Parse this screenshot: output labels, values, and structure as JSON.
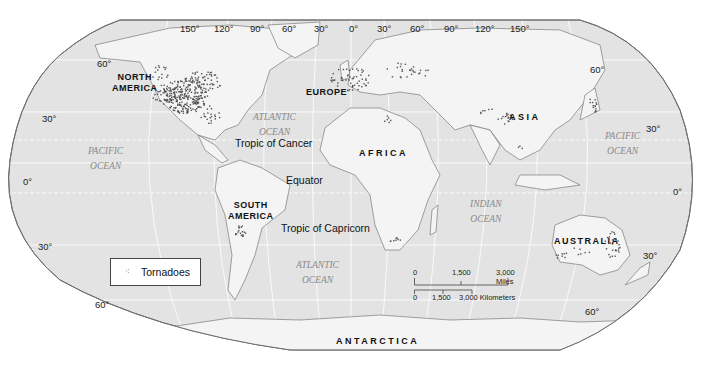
{
  "map": {
    "title": "World Tornado Distribution",
    "projection": "Robinson (oval)",
    "colors": {
      "ocean": "#e3e3e3",
      "land": "#f4f4f4",
      "graticule": "#ffffff",
      "outline": "#6e6e6e",
      "tornado_dots": "#555555"
    },
    "longitude_labels": [
      "150°",
      "120°",
      "90°",
      "60°",
      "30°",
      "0°",
      "30°",
      "60°",
      "90°",
      "120°",
      "150°"
    ],
    "latitude_labels_left": [
      "60°",
      "30°",
      "0°",
      "30°",
      "60°"
    ],
    "latitude_labels_right": [
      "60°",
      "30°",
      "0°",
      "30°",
      "60°"
    ],
    "continents": {
      "north_america": [
        "NORTH",
        "AMERICA"
      ],
      "south_america": [
        "SOUTH",
        "AMERICA"
      ],
      "europe": "EUROPE",
      "africa": "AFRICA",
      "asia": "ASIA",
      "australia": "AUSTRALIA",
      "antarctica": "ANTARCTICA"
    },
    "oceans": {
      "pacific_west": [
        "PACIFIC",
        "OCEAN"
      ],
      "pacific_east": [
        "PACIFIC",
        "OCEAN"
      ],
      "atlantic_north": [
        "ATLANTIC",
        "OCEAN"
      ],
      "atlantic_south": [
        "ATLANTIC",
        "OCEAN"
      ],
      "indian": [
        "INDIAN",
        "OCEAN"
      ]
    },
    "reference_lines": {
      "tropic_cancer": "Tropic of Cancer",
      "equator": "Equator",
      "tropic_capricorn": "Tropic of Capricorn"
    },
    "legend": {
      "symbol": "⁖",
      "label": "Tornadoes"
    },
    "scale_bar": {
      "miles": [
        "0",
        "1,500",
        "3,000 Miles"
      ],
      "kilometers": [
        "0",
        "1,500",
        "3,000 Kilometers"
      ]
    }
  }
}
